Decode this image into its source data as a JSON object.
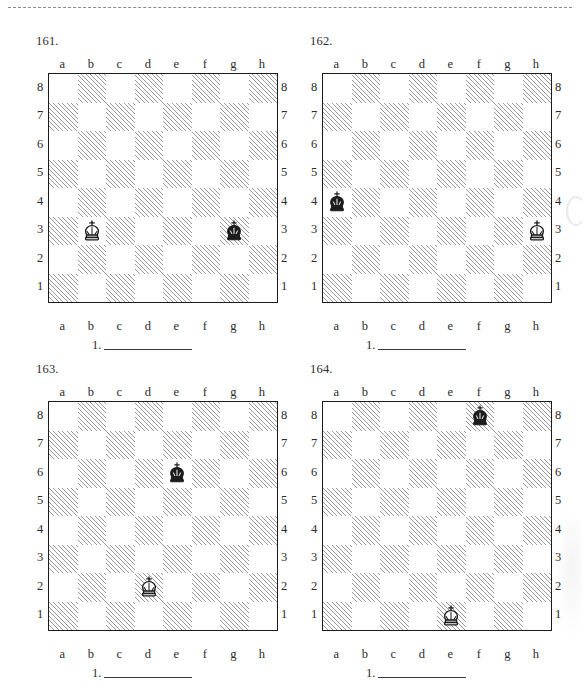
{
  "page": {
    "separator": "dashed-rule",
    "board_files": [
      "a",
      "b",
      "c",
      "d",
      "e",
      "f",
      "g",
      "h"
    ],
    "board_ranks": [
      "8",
      "7",
      "6",
      "5",
      "4",
      "3",
      "2",
      "1"
    ],
    "answer_label": "1.",
    "colors": {
      "ink": "#1c1c1c",
      "label": "#2b2b2b",
      "dark_square_hatch": "#9a9a9a",
      "light_square": "#ffffff",
      "rule": "#3a3a3a"
    }
  },
  "puzzles": [
    {
      "number": "161.",
      "pieces": [
        {
          "piece": "white-king",
          "color": "white",
          "square": "b3",
          "file": "b",
          "rank": "3"
        },
        {
          "piece": "black-king",
          "color": "black",
          "square": "g3",
          "file": "g",
          "rank": "3"
        }
      ],
      "answer_label": "1."
    },
    {
      "number": "162.",
      "pieces": [
        {
          "piece": "black-king",
          "color": "black",
          "square": "a4",
          "file": "a",
          "rank": "4"
        },
        {
          "piece": "white-king",
          "color": "white",
          "square": "h3",
          "file": "h",
          "rank": "3"
        }
      ],
      "answer_label": "1."
    },
    {
      "number": "163.",
      "pieces": [
        {
          "piece": "black-king",
          "color": "black",
          "square": "e6",
          "file": "e",
          "rank": "6"
        },
        {
          "piece": "white-king",
          "color": "white",
          "square": "d2",
          "file": "d",
          "rank": "2"
        }
      ],
      "answer_label": "1."
    },
    {
      "number": "164.",
      "pieces": [
        {
          "piece": "black-king",
          "color": "black",
          "square": "f8",
          "file": "f",
          "rank": "8"
        },
        {
          "piece": "white-king",
          "color": "white",
          "square": "e1",
          "file": "e",
          "rank": "1"
        }
      ],
      "answer_label": "1."
    }
  ]
}
